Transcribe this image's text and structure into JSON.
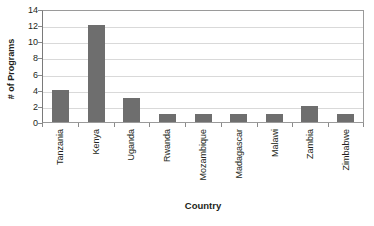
{
  "chart_data": {
    "type": "bar",
    "title": "",
    "xlabel": "Country",
    "ylabel": "# of Programs",
    "categories": [
      "Tanzania",
      "Kenya",
      "Uganda",
      "Rwanda",
      "Mozambique",
      "Madagascar",
      "Malawi",
      "Zambia",
      "Zimbabwe"
    ],
    "values": [
      4,
      12,
      3,
      1,
      1,
      1,
      1,
      2,
      1
    ],
    "ylim": [
      0,
      14
    ],
    "ytick_values": [
      14,
      12,
      10,
      8,
      6,
      4,
      2,
      0
    ],
    "ytick_labels": [
      "14",
      "12",
      "10",
      "8",
      "6",
      "4",
      "2",
      "0"
    ],
    "ytick_step": 2,
    "grid": true,
    "grid_axis": "y",
    "legend": false,
    "legend_position": "none",
    "orientation": "vertical",
    "bar_color": "#6e6e6e",
    "gridline_color": "#d9d9d9",
    "axis_color": "#8a8a8a",
    "plot_border_color": "#9a9a9a",
    "background_color": "#ffffff",
    "text_color": "#231f20",
    "xtick_label_rotation": -90
  }
}
